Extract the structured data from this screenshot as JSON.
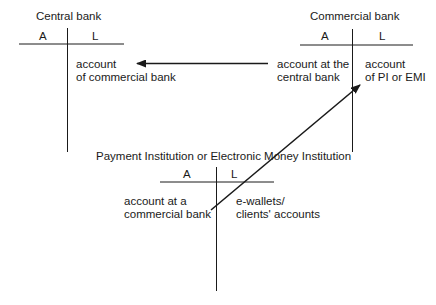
{
  "central_bank": {
    "title": "Central bank",
    "col_a": "A",
    "col_l": "L",
    "liability_line1": "account",
    "liability_line2": "of commercial bank"
  },
  "commercial_bank": {
    "title": "Commercial bank",
    "col_a": "A",
    "col_l": "L",
    "asset_line1": "account at the",
    "asset_line2": "central bank",
    "liability_line1": "account",
    "liability_line2": "of PI or EMI"
  },
  "payment_institution": {
    "title": "Payment Institution or Electronic Money Institution",
    "col_a": "A",
    "col_l": "L",
    "asset_line1": "account at a",
    "asset_line2": "commercial bank",
    "liability_line1": "e-wallets/",
    "liability_line2": "clients' accounts"
  },
  "arrows": [
    {
      "from": "commercial_bank.asset",
      "to": "central_bank.liability"
    },
    {
      "from": "payment_institution.asset",
      "to": "commercial_bank.liability"
    }
  ],
  "colors": {
    "line": "#1a1a1a",
    "background": "#ffffff"
  }
}
